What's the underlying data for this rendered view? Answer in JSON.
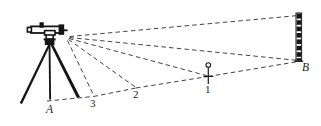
{
  "figure": {
    "background_color": "#ffffff",
    "line_color": "#1a1a1a",
    "dashed_line_color": "#3a3a3a"
  },
  "labels": {
    "station_a": "A",
    "point_3": "3",
    "point_2": "2",
    "point_1": "1",
    "station_b": "B"
  },
  "objects": {
    "instrument_name": "level-instrument",
    "tripod_name": "tripod",
    "staff_name": "leveling-staff",
    "peg_name": "survey-peg"
  },
  "geometry": {
    "instrument_origin": [
      68,
      37
    ],
    "ground_points": {
      "A": [
        60,
        97
      ],
      "3": [
        93,
        96
      ],
      "2": [
        136,
        87
      ],
      "1": [
        208,
        76
      ],
      "B": [
        299,
        61
      ]
    },
    "staff_top": [
      299,
      14
    ],
    "staff_bottom": [
      299,
      61
    ],
    "sight_lines": [
      {
        "from": "instrument",
        "to": "3"
      },
      {
        "from": "instrument",
        "to": "2"
      },
      {
        "from": "instrument",
        "to": "1"
      },
      {
        "from": "instrument",
        "to": "B"
      },
      {
        "from": "instrument",
        "to": "staff_top"
      }
    ],
    "ground_line": [
      "A",
      "3",
      "2",
      "1",
      "B"
    ]
  }
}
